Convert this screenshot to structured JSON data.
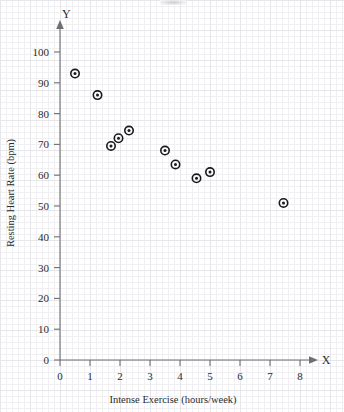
{
  "chart_data": {
    "type": "scatter",
    "title": "",
    "xlabel": "Intense Exercise (hours/week)",
    "ylabel": "Resting Heart Rate (bpm)",
    "x_axis_letter": "X",
    "y_axis_letter": "Y",
    "xlim": [
      0,
      8.8
    ],
    "ylim": [
      0,
      108
    ],
    "xticks": [
      0,
      1,
      2,
      3,
      4,
      5,
      6,
      7,
      8
    ],
    "xtick_labels": [
      "0",
      "1",
      "2",
      "3",
      "4",
      "5",
      "6",
      "7",
      "8"
    ],
    "yticks": [
      0,
      10,
      20,
      30,
      40,
      50,
      60,
      70,
      80,
      90,
      100
    ],
    "ytick_labels": [
      "0",
      "10",
      "20",
      "30",
      "40",
      "50",
      "60",
      "70",
      "80",
      "90",
      "100"
    ],
    "grid": true,
    "grid_style": "graph-paper",
    "legend": null,
    "marker": "bullseye",
    "marker_color": "#1a1a1a",
    "points": [
      {
        "x": 0.5,
        "y": 93
      },
      {
        "x": 1.25,
        "y": 86
      },
      {
        "x": 1.7,
        "y": 69.5
      },
      {
        "x": 1.95,
        "y": 72
      },
      {
        "x": 2.3,
        "y": 74.5
      },
      {
        "x": 3.5,
        "y": 68
      },
      {
        "x": 3.85,
        "y": 63.5
      },
      {
        "x": 4.55,
        "y": 59
      },
      {
        "x": 5.0,
        "y": 61
      },
      {
        "x": 7.45,
        "y": 51
      }
    ]
  },
  "axes": {
    "x_letter": "X",
    "y_letter": "Y",
    "x_title": "Intense Exercise (hours/week)",
    "y_title": "Resting Heart Rate (bpm)"
  },
  "colors": {
    "axis": "#6e6e73",
    "marker": "#1a1a1a",
    "grid_minor": "#f0f0f2",
    "grid_major": "#e6e6ea",
    "text": "#2b2b2b",
    "background": "#ffffff"
  }
}
